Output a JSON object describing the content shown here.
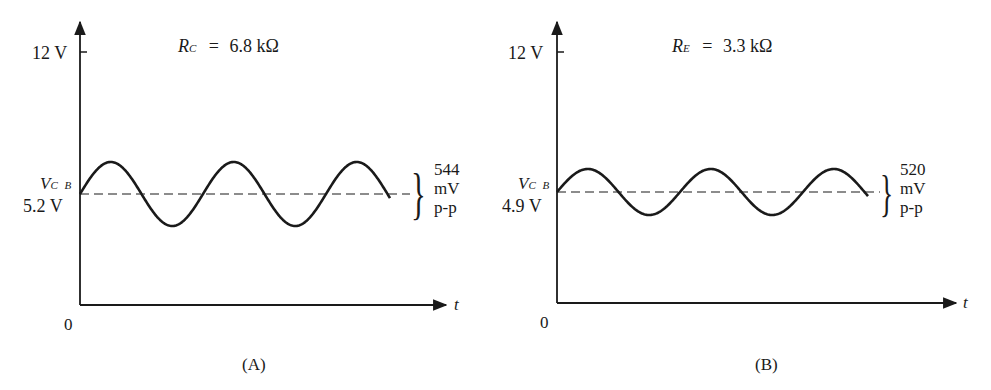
{
  "figure": {
    "panels": [
      {
        "id": "A",
        "caption": "(A)",
        "parameter": {
          "symbol": "R",
          "subscript": "C",
          "equals": "=",
          "value": "6.8 kΩ"
        },
        "y_axis": {
          "top_label": "12 V",
          "origin_label": "0"
        },
        "x_axis": {
          "label": "t"
        },
        "dc_level": {
          "symbol": "V",
          "subscript": "C B",
          "value": "5.2 V"
        },
        "ac_annotation": {
          "line1": "544",
          "line2": "mV",
          "line3": "p-p"
        },
        "geometry": {
          "axis_x": 80,
          "axis_top": 22,
          "tick_y": 52,
          "axis_bottom": 305,
          "axis_right": 446,
          "dc_y": 194,
          "amp": 32,
          "period": 123,
          "wave_end": 390,
          "dash_end": 410
        }
      },
      {
        "id": "B",
        "caption": "(B)",
        "parameter": {
          "symbol": "R",
          "subscript": "E",
          "equals": "=",
          "value": "3.3 kΩ"
        },
        "y_axis": {
          "top_label": "12 V",
          "origin_label": "0"
        },
        "x_axis": {
          "label": "t"
        },
        "dc_level": {
          "symbol": "V",
          "subscript": "C B",
          "value": "4.9 V"
        },
        "ac_annotation": {
          "line1": "520",
          "line2": "mV",
          "line3": "p-p"
        },
        "geometry": {
          "axis_x": 557,
          "axis_top": 22,
          "tick_y": 52,
          "axis_bottom": 303,
          "axis_right": 956,
          "dc_y": 192,
          "amp": 23,
          "period": 123,
          "wave_end": 868,
          "dash_end": 880
        }
      }
    ]
  },
  "chart_data": [
    {
      "type": "line",
      "title": "R_C = 6.8 kΩ",
      "panel": "(A)",
      "xlabel": "t",
      "ylabel": "",
      "y_ticks": [
        "0",
        "12 V"
      ],
      "ylim": [
        0,
        12
      ],
      "dc_level_label": "V_CB 5.2 V",
      "dc_level": 5.2,
      "peak_to_peak_mV": 544,
      "cycles": 2.75,
      "waveform": "sine"
    },
    {
      "type": "line",
      "title": "R_E = 3.3 kΩ",
      "panel": "(B)",
      "xlabel": "t",
      "ylabel": "",
      "y_ticks": [
        "0",
        "12 V"
      ],
      "ylim": [
        0,
        12
      ],
      "dc_level_label": "V_CB 4.9 V",
      "dc_level": 4.9,
      "peak_to_peak_mV": 520,
      "cycles": 2.5,
      "waveform": "sine"
    }
  ]
}
